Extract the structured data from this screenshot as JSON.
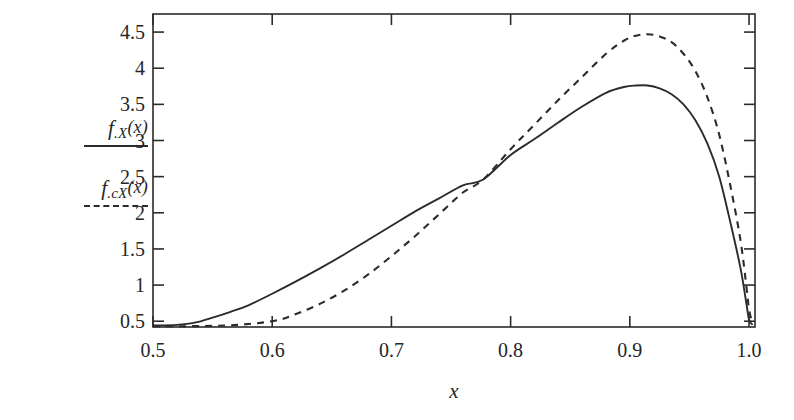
{
  "figure": {
    "width": 794,
    "height": 420,
    "background": "#ffffff",
    "axis_color": "#2b2b2b"
  },
  "legend": {
    "position": "left-outside",
    "entries": [
      {
        "name": "f.X(x)",
        "base": "f",
        "subscript": ".X",
        "argument": "(x)",
        "style": "solid",
        "color": "#2b2b2b"
      },
      {
        "name": "f.cX(x)",
        "base": "f",
        "subscript": ".cX",
        "argument": "(x)",
        "style": "dashed",
        "color": "#2b2b2b"
      }
    ]
  },
  "chart_data": {
    "type": "line",
    "title": "",
    "xlabel": "x",
    "ylabel": "",
    "grid": false,
    "legend_position": "left-outside",
    "xlim": [
      0.5,
      1.005
    ],
    "ylim": [
      0.42,
      4.75
    ],
    "xticks": [
      0.5,
      0.6,
      0.7,
      0.8,
      0.9,
      1.0
    ],
    "xtick_labels": [
      "0.5",
      "0.6",
      "0.7",
      "0.8",
      "0.9",
      "1.0"
    ],
    "yticks": [
      0.5,
      1,
      1.5,
      2,
      2.5,
      3,
      3.5,
      4,
      4.5
    ],
    "ytick_labels": [
      "0.5",
      "1",
      "1.5",
      "2",
      "2.5",
      "3",
      "3.5",
      "4",
      "4.5"
    ],
    "series": [
      {
        "name": "f.X(x)",
        "style": "solid",
        "color": "#2b2b2b",
        "x": [
          0.5,
          0.52,
          0.535,
          0.55,
          0.565,
          0.58,
          0.6,
          0.62,
          0.64,
          0.66,
          0.68,
          0.7,
          0.72,
          0.74,
          0.76,
          0.777,
          0.8,
          0.82,
          0.84,
          0.86,
          0.88,
          0.895,
          0.905,
          0.915,
          0.925,
          0.935,
          0.945,
          0.955,
          0.965,
          0.975,
          0.985,
          0.993,
          0.998,
          1.0,
          1.003
        ],
        "y": [
          0.44,
          0.45,
          0.48,
          0.55,
          0.63,
          0.72,
          0.88,
          1.05,
          1.23,
          1.42,
          1.62,
          1.82,
          2.02,
          2.2,
          2.38,
          2.46,
          2.8,
          3.02,
          3.25,
          3.47,
          3.66,
          3.74,
          3.76,
          3.76,
          3.72,
          3.64,
          3.5,
          3.28,
          2.96,
          2.5,
          1.82,
          1.22,
          0.72,
          0.52,
          0.45
        ]
      },
      {
        "name": "f.cX(x)",
        "style": "dashed",
        "color": "#2b2b2b",
        "x": [
          0.5,
          0.56,
          0.6,
          0.62,
          0.64,
          0.66,
          0.68,
          0.7,
          0.72,
          0.74,
          0.76,
          0.777,
          0.8,
          0.82,
          0.84,
          0.86,
          0.88,
          0.895,
          0.905,
          0.915,
          0.925,
          0.935,
          0.945,
          0.955,
          0.965,
          0.975,
          0.985,
          0.993,
          0.998,
          1.0,
          1.003
        ],
        "y": [
          0.43,
          0.44,
          0.5,
          0.6,
          0.74,
          0.92,
          1.14,
          1.4,
          1.68,
          1.98,
          2.28,
          2.46,
          2.88,
          3.22,
          3.56,
          3.88,
          4.2,
          4.38,
          4.45,
          4.47,
          4.44,
          4.36,
          4.2,
          3.96,
          3.6,
          3.08,
          2.32,
          1.6,
          0.95,
          0.66,
          0.46
        ]
      }
    ],
    "annotations": {
      "crossover_x": 0.777,
      "crossover_y": 2.46,
      "solid_peak": {
        "x": 0.91,
        "y": 3.76
      },
      "dashed_peak": {
        "x": 0.915,
        "y": 4.47
      }
    }
  }
}
